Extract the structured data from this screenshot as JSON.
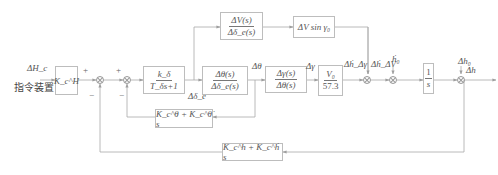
{
  "diagram": {
    "type": "control-block-diagram",
    "input": {
      "signal": "ΔH_c",
      "source_label": "指令装置"
    },
    "output": {
      "signal": "Δh"
    },
    "blocks": {
      "k_h_gain": {
        "text": "K_c^H"
      },
      "servo": {
        "num": "k_δ",
        "den": "T_δs+1"
      },
      "pitch_tf": {
        "num": "Δθ(s)",
        "den": "Δδ_e(s)"
      },
      "speed_tf": {
        "num": "ΔV(s)",
        "den": "Δδ_e(s)"
      },
      "v_sin": {
        "text": "ΔV sin γ₀"
      },
      "gamma_tf": {
        "num": "Δγ(s)",
        "den": "Δθ(s)"
      },
      "v_gain": {
        "num": "V₀",
        "den": "57.3"
      },
      "integrator": {
        "num": "1",
        "den": "s"
      },
      "theta_feedback": {
        "text": "K_c^θ + K_c^θ̇ s"
      },
      "h_feedback": {
        "text": "K_c^h + K_c^ḣ s"
      }
    },
    "signals": {
      "delta_e": "Δδ_e",
      "theta": "Δθ",
      "gamma": "Δγ",
      "hdot_dgamma": "Δḣ_Δγ",
      "hdot_dv": "Δḣ_ΔV",
      "hdot0": "ḣ₀",
      "h0": "Δh₀",
      "h": "Δh"
    },
    "signs": {
      "sum1_plus": "+",
      "sum1_minus": "−",
      "sum2_plus": "+",
      "sum2_minus": "−"
    },
    "colors": {
      "line": "#9e9e9e",
      "box_border": "#bdbdbd",
      "text": "#555555"
    }
  }
}
